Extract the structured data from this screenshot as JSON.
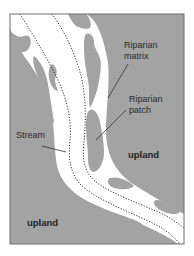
{
  "diagram": {
    "kind": "riparian corridor schematic",
    "colors": {
      "upland": "#a3a3a3",
      "corridor": "#ffffff",
      "frame": "#6e6e6e",
      "stream_banks": "#333333",
      "leader": "#333333",
      "text": "#2a2a2a"
    },
    "labels": {
      "riparian_matrix_line1": "Riparian",
      "riparian_matrix_line2": "matrix",
      "riparian_patch_line1": "Riparian",
      "riparian_patch_line2": "patch",
      "stream": "Stream",
      "upland_right": "upland",
      "upland_left": "upland"
    },
    "legend_items": [
      {
        "name": "Riparian matrix",
        "meaning": "white corridor area"
      },
      {
        "name": "Riparian patch",
        "meaning": "gray patch inside corridor"
      },
      {
        "name": "Stream",
        "meaning": "channel bounded by dotted lines"
      },
      {
        "name": "upland",
        "meaning": "gray area outside corridor"
      }
    ]
  }
}
